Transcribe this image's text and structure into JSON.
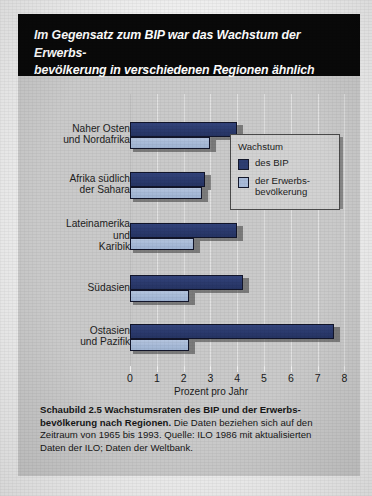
{
  "title": {
    "line1": "Im Gegensatz zum BIP war das Wachstum der Erwerbs-",
    "line2": "bevölkerung in verschiedenen Regionen ähnlich"
  },
  "legend": {
    "title": "Wachstum",
    "items": [
      {
        "label": "des BIP",
        "color": "#2d3e72"
      },
      {
        "label": "der Erwerbs-\nbevölkerung",
        "color": "#a9bbd9"
      }
    ]
  },
  "caption": {
    "bold": "Schaubild 2.5   Wachstumsraten des BIP und der Erwerbs-bevölkerung nach Regionen.",
    "rest": " Die Daten beziehen sich auf den Zeitraum von 1965 bis 1993. Quelle: ILO 1986 mit aktualisierten Daten der ILO; Daten der Weltbank."
  },
  "colors": {
    "banner": "#090909",
    "page": "#cacaca",
    "gdp": "#2d3e72",
    "population": "#a9bbd9",
    "bar_outline": "#12152a",
    "gridline": "#e2e2e2"
  },
  "chart_data": {
    "type": "bar",
    "orientation": "horizontal",
    "xlabel": "Prozent pro Jahr",
    "ylabel": "",
    "xlim": [
      0,
      8
    ],
    "xticks": [
      0,
      1,
      2,
      3,
      4,
      5,
      6,
      7,
      8
    ],
    "xtick_labels": [
      "0",
      "1",
      "2",
      "3",
      "4",
      "5",
      "6",
      "7",
      "8"
    ],
    "grid": true,
    "legend_position": "inside-upper-right",
    "categories": [
      "Naher Osten und Nordafrika",
      "Afrika südlich der Sahara",
      "Lateinamerika und Karibik",
      "Südasien",
      "Ostasien und Pazifik"
    ],
    "category_lines": [
      [
        "Naher Osten",
        "und Nordafrika"
      ],
      [
        "Afrika südlich",
        "der Sahara"
      ],
      [
        "Lateinamerika",
        "und",
        "Karibik"
      ],
      [
        "Südasien"
      ],
      [
        "Ostasien",
        "und Pazifik"
      ]
    ],
    "series": [
      {
        "name": "des BIP",
        "color": "#2d3e72",
        "values": [
          4.0,
          2.8,
          4.0,
          4.2,
          7.6
        ]
      },
      {
        "name": "der Erwerbsbevölkerung",
        "color": "#a9bbd9",
        "values": [
          3.0,
          2.7,
          2.4,
          2.2,
          2.2
        ]
      }
    ]
  }
}
